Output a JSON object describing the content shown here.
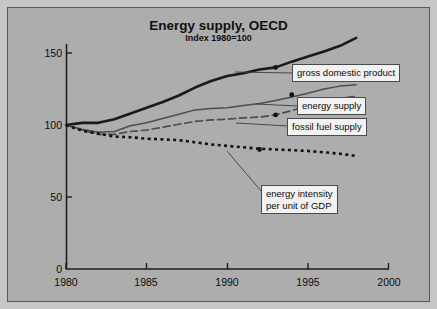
{
  "figure": {
    "background_color": "#adadad",
    "frame_color": "#c6c6c6",
    "border_color": "#585858"
  },
  "title": "Energy supply, OECD",
  "subtitle": "Index 1980=100",
  "axis": {
    "y_ticks": [
      "0",
      "50",
      "100",
      "150"
    ],
    "x_ticks": [
      "1980",
      "1985",
      "1990",
      "1995",
      "2000"
    ]
  },
  "callouts": {
    "gdp": "gross domestic product",
    "energy_supply": "energy supply",
    "fossil_fuel": "fossil fuel supply",
    "energy_intensity_line1": "energy intensity",
    "energy_intensity_line2": "per unit of GDP"
  },
  "chart_data": {
    "type": "line",
    "title": "Energy supply, OECD",
    "subtitle": "Index 1980=100",
    "xlabel": "",
    "ylabel": "",
    "xlim": [
      1980,
      2000
    ],
    "ylim": [
      0,
      160
    ],
    "y_ticks": [
      0,
      50,
      100,
      150
    ],
    "x_ticks": [
      1980,
      1985,
      1990,
      1995,
      2000
    ],
    "grid": false,
    "legend": "callout-labels",
    "x": [
      1980,
      1981,
      1982,
      1983,
      1984,
      1985,
      1986,
      1987,
      1988,
      1989,
      1990,
      1991,
      1992,
      1993,
      1994,
      1995,
      1996,
      1997,
      1998
    ],
    "series": [
      {
        "name": "gross domestic product",
        "style": "solid-thick",
        "color": "#1a1a1a",
        "marker_year": 1993,
        "marker_value": 140,
        "values": [
          100,
          101.5,
          101.5,
          104,
          108,
          112,
          116,
          120.5,
          126,
          130.5,
          134,
          136,
          138.5,
          140,
          144,
          147.5,
          151,
          155,
          160.5
        ]
      },
      {
        "name": "energy supply",
        "style": "solid-thin",
        "color": "#4d4d4d",
        "marker_year": 1994,
        "marker_value": 121,
        "values": [
          100,
          97,
          95,
          95.5,
          99.5,
          101.5,
          104.5,
          107.5,
          110.5,
          111.5,
          112,
          113.5,
          115,
          117,
          119.5,
          122,
          125,
          127,
          128
        ]
      },
      {
        "name": "fossil fuel supply",
        "style": "dashed",
        "color": "#4d4d4d",
        "marker_year": 1993,
        "marker_value": 107,
        "values": [
          100,
          96.5,
          93.5,
          93.5,
          95.5,
          96.5,
          98.5,
          100.5,
          102.5,
          103.5,
          104,
          105,
          105.5,
          107,
          110,
          113.5,
          116.5,
          118.5,
          120
        ]
      },
      {
        "name": "energy intensity per unit of GDP",
        "style": "dotted",
        "color": "#121212",
        "marker_year": 1992,
        "marker_value": 83,
        "values": [
          100,
          96,
          94,
          92,
          91.5,
          90.5,
          90,
          89.5,
          88,
          86.5,
          85.5,
          84.5,
          83.5,
          83,
          82.5,
          82,
          81,
          80,
          78.5
        ]
      }
    ]
  }
}
